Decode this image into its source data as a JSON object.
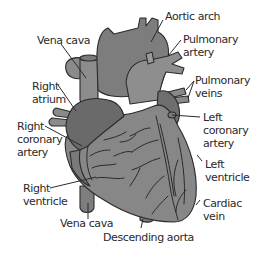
{
  "diagram": {
    "colors": {
      "background": "#ffffff",
      "vessel_light": "#8c8c8c",
      "vessel_mid": "#7a7a7a",
      "chamber_dark": "#6b6b6b",
      "ventricle": "#858585",
      "outline": "#2b2b2b",
      "label_text": "#2a2a2a"
    },
    "labels": {
      "aortic_arch": [
        "Aortic arch"
      ],
      "vena_cava_top": [
        "Vena cava"
      ],
      "pulmonary_artery": [
        "Pulmonary",
        "artery"
      ],
      "pulmonary_veins": [
        "Pulmonary",
        "veins"
      ],
      "right_atrium": [
        "Right",
        "atrium"
      ],
      "left_coronary_artery": [
        "Left",
        "coronary",
        "artery"
      ],
      "right_coronary_artery": [
        "Right",
        "coronary",
        "artery"
      ],
      "left_ventricle": [
        "Left",
        "ventricle"
      ],
      "right_ventricle": [
        "Right",
        "ventricle"
      ],
      "cardiac_vein": [
        "Cardiac",
        "vein"
      ],
      "vena_cava_bottom": [
        "Vena cava"
      ],
      "descending_aorta": [
        "Descending aorta"
      ]
    }
  }
}
